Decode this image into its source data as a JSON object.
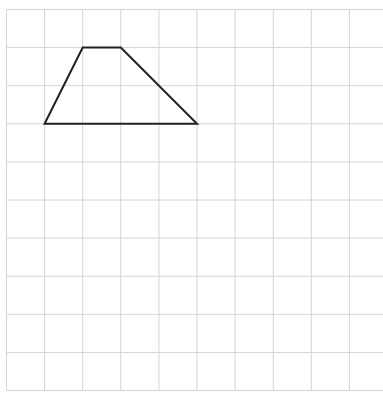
{
  "diagram": {
    "type": "grid-with-trapezoid",
    "grid": {
      "origin_x": 6.5,
      "origin_y": 9.5,
      "cell_size": 38.1,
      "columns": 10,
      "rows": 10,
      "line_color": "#d4d4d4",
      "extends_right": true
    },
    "shape": {
      "name": "trapezoid",
      "grid_vertices": [
        [
          1,
          3
        ],
        [
          2,
          1
        ],
        [
          3,
          1
        ],
        [
          5,
          3
        ]
      ],
      "stroke_color": "#222222",
      "stroke_width": 2
    }
  }
}
